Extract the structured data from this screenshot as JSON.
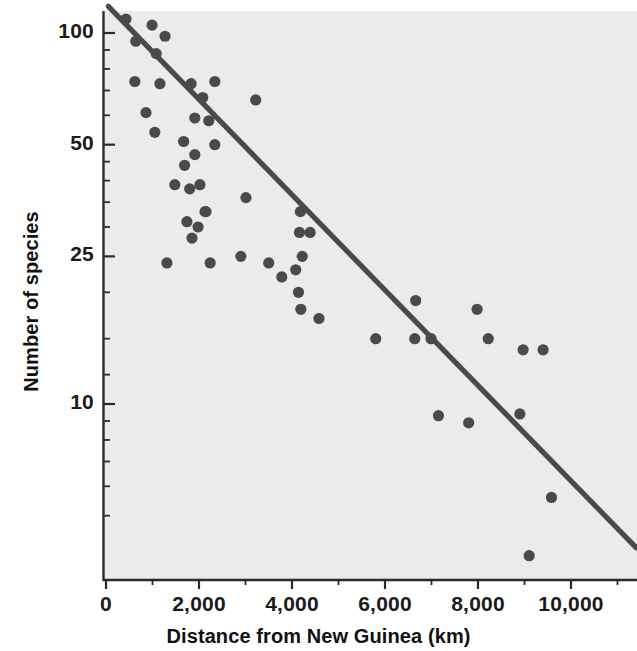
{
  "figure": {
    "kind": "scatter-plot",
    "background_color": "#ffffff",
    "plot_background_color": "#ebebeb",
    "ink_color": "#4a4a4a"
  },
  "axes": {
    "x_title": "Distance from New Guinea (km)",
    "y_title": "Number of species",
    "x_ticks": [
      "0",
      "2,000",
      "4,000",
      "6,000",
      "8,000",
      "10,000"
    ],
    "y_ticks": [
      "100",
      "50",
      "25",
      "10"
    ]
  },
  "bleed_text": [
    {
      "text": "the \"island\" effect",
      "x": 330,
      "y": 48,
      "size": 27
    },
    {
      "text": "of species on",
      "x": 395,
      "y": 112,
      "size": 17
    },
    {
      "text": "an island",
      "x": 432,
      "y": 136,
      "size": 17
    },
    {
      "text": "ecreases",
      "x": 425,
      "y": 160,
      "size": 17
    },
    {
      "text": "distance has",
      "x": 400,
      "y": 184,
      "size": 17
    },
    {
      "text": "from a",
      "x": 440,
      "y": 208,
      "size": 17
    },
    {
      "text": "number of",
      "x": 418,
      "y": 232,
      "size": 17
    },
    {
      "text": "species",
      "x": 440,
      "y": 256,
      "size": 17
    },
    {
      "text": "decreases",
      "x": 416,
      "y": 280,
      "size": 17
    },
    {
      "text": "the distance",
      "x": 398,
      "y": 304,
      "size": 17
    },
    {
      "text": "from the",
      "x": 432,
      "y": 328,
      "size": 17
    },
    {
      "text": "mainland",
      "x": 424,
      "y": 352,
      "size": 17
    },
    {
      "text": "increases.",
      "x": 420,
      "y": 376,
      "size": 17
    },
    {
      "text": "FIGURE 3  Species diversity declines as",
      "x": 150,
      "y": 444,
      "size": 17
    },
    {
      "text": "a function of distance from source.",
      "x": 180,
      "y": 468,
      "size": 17
    },
    {
      "text": "that the number",
      "x": 120,
      "y": 404,
      "size": 17
    },
    {
      "text": "of species",
      "x": 160,
      "y": 426,
      "size": 17
    },
    {
      "text": "island",
      "x": 300,
      "y": 520,
      "size": 17
    },
    {
      "text": "total",
      "x": 320,
      "y": 544,
      "size": 17
    }
  ],
  "chart_data": {
    "type": "scatter",
    "title": "",
    "xlabel": "Distance from New Guinea (km)",
    "ylabel": "Number of species",
    "xlim": [
      0,
      11400
    ],
    "ylim": [
      3,
      125
    ],
    "yscale": "log",
    "xscale": "linear",
    "grid": false,
    "legend": null,
    "x_ticks": [
      0,
      2000,
      4000,
      6000,
      8000,
      10000
    ],
    "x_minor_tick_step": 1000,
    "y_ticks": [
      100,
      50,
      25,
      10
    ],
    "points": [
      {
        "x": 430,
        "y": 109
      },
      {
        "x": 990,
        "y": 105
      },
      {
        "x": 1270,
        "y": 98
      },
      {
        "x": 640,
        "y": 95
      },
      {
        "x": 1080,
        "y": 88
      },
      {
        "x": 620,
        "y": 74
      },
      {
        "x": 1160,
        "y": 73
      },
      {
        "x": 1830,
        "y": 73
      },
      {
        "x": 2340,
        "y": 74
      },
      {
        "x": 2080,
        "y": 67
      },
      {
        "x": 3220,
        "y": 66
      },
      {
        "x": 860,
        "y": 61
      },
      {
        "x": 1910,
        "y": 59
      },
      {
        "x": 2210,
        "y": 58
      },
      {
        "x": 1050,
        "y": 54
      },
      {
        "x": 1670,
        "y": 51
      },
      {
        "x": 2340,
        "y": 50
      },
      {
        "x": 1910,
        "y": 47
      },
      {
        "x": 1690,
        "y": 44
      },
      {
        "x": 1480,
        "y": 39
      },
      {
        "x": 1800,
        "y": 38
      },
      {
        "x": 2020,
        "y": 39
      },
      {
        "x": 3010,
        "y": 36
      },
      {
        "x": 2130,
        "y": 33
      },
      {
        "x": 1740,
        "y": 31
      },
      {
        "x": 1980,
        "y": 30
      },
      {
        "x": 1850,
        "y": 28
      },
      {
        "x": 2150,
        "y": 33
      },
      {
        "x": 4180,
        "y": 33
      },
      {
        "x": 4160,
        "y": 29
      },
      {
        "x": 4390,
        "y": 29
      },
      {
        "x": 4220,
        "y": 25
      },
      {
        "x": 1310,
        "y": 24
      },
      {
        "x": 2240,
        "y": 24
      },
      {
        "x": 2900,
        "y": 25
      },
      {
        "x": 3500,
        "y": 24
      },
      {
        "x": 4080,
        "y": 23
      },
      {
        "x": 3780,
        "y": 22
      },
      {
        "x": 4140,
        "y": 20
      },
      {
        "x": 4190,
        "y": 18
      },
      {
        "x": 4580,
        "y": 17
      },
      {
        "x": 6660,
        "y": 19
      },
      {
        "x": 7980,
        "y": 18
      },
      {
        "x": 6990,
        "y": 15
      },
      {
        "x": 5800,
        "y": 15
      },
      {
        "x": 6640,
        "y": 15
      },
      {
        "x": 8220,
        "y": 15
      },
      {
        "x": 8970,
        "y": 14
      },
      {
        "x": 9400,
        "y": 14
      },
      {
        "x": 7150,
        "y": 9.3
      },
      {
        "x": 7800,
        "y": 8.9
      },
      {
        "x": 8900,
        "y": 9.4
      },
      {
        "x": 9580,
        "y": 5.6
      },
      {
        "x": 9100,
        "y": 3.9
      }
    ],
    "trendline": {
      "label": "fitted regression line",
      "x_start": 50,
      "y_start": 118,
      "x_end": 11400,
      "y_end": 4.1
    }
  }
}
